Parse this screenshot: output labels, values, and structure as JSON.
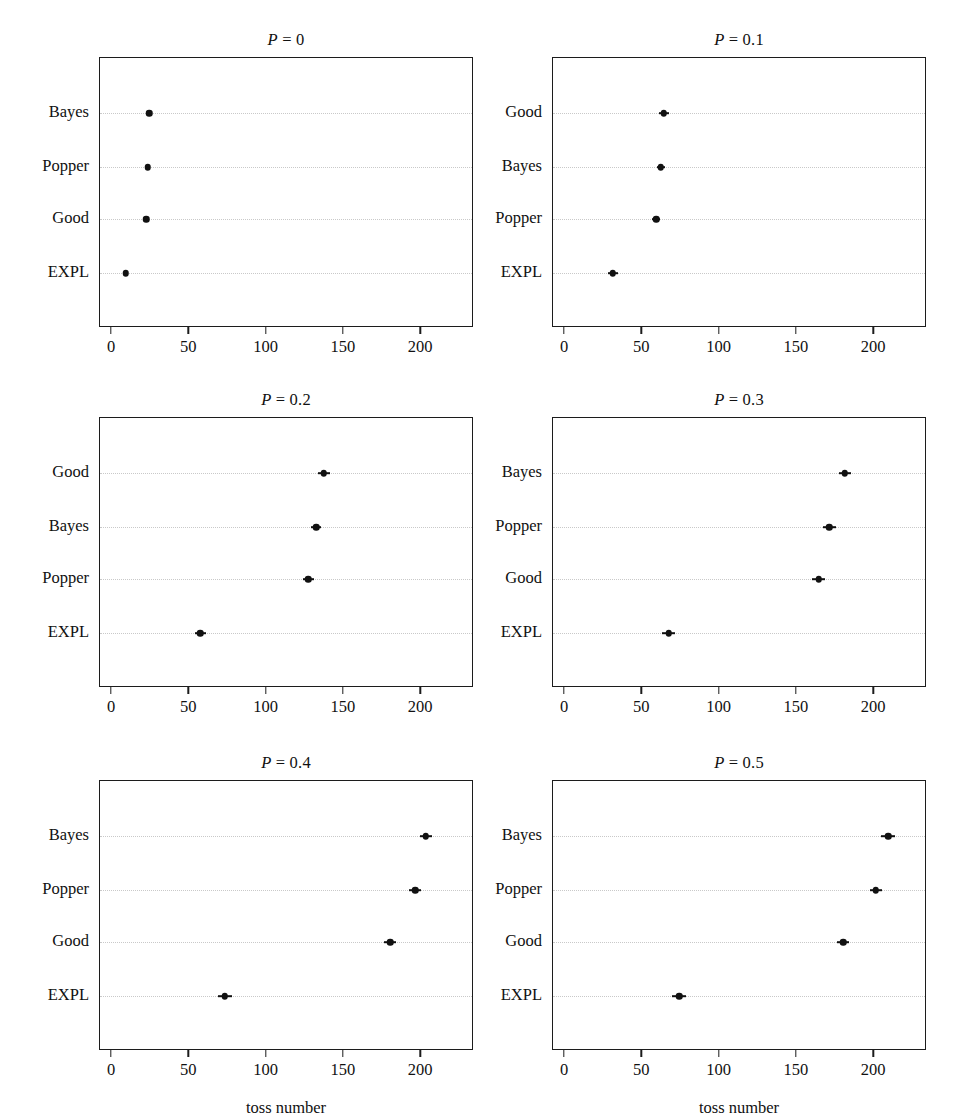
{
  "figure": {
    "xlabel": "toss number",
    "xtick_labels": [
      "0",
      "50",
      "100",
      "150",
      "200"
    ],
    "xticks": [
      0,
      50,
      100,
      150,
      200
    ],
    "xlim": [
      -8,
      234
    ],
    "marker_color": "#111111",
    "grid_color": "#c9c9c9",
    "axis_color": "#1c1c1c"
  },
  "chart_data": {
    "type": "scatter",
    "xlabel": "toss number",
    "ylabel": "",
    "xlim": [
      -8,
      234
    ],
    "xticks": [
      0,
      50,
      100,
      150,
      200
    ],
    "grid": true,
    "legend": "none",
    "orientation": "horizontal",
    "error_bars": "symmetric horizontal",
    "panels": [
      {
        "title_prefix": "P",
        "title_eq": "=",
        "title_value": "0",
        "title": "P = 0",
        "categories": [
          "Bayes",
          "Popper",
          "Good",
          "EXPL"
        ],
        "values": [
          24,
          23,
          22,
          9
        ],
        "errors": [
          1.5,
          1.5,
          1.5,
          1.5
        ]
      },
      {
        "title_prefix": "P",
        "title_eq": "=",
        "title_value": "0.1",
        "title": "P = 0.1",
        "categories": [
          "Good",
          "Bayes",
          "Popper",
          "EXPL"
        ],
        "values": [
          64,
          62,
          59,
          31
        ],
        "errors": [
          3.5,
          2.5,
          2.5,
          3.0
        ]
      },
      {
        "title_prefix": "P",
        "title_eq": "=",
        "title_value": "0.2",
        "title": "P = 0.2",
        "categories": [
          "Good",
          "Bayes",
          "Popper",
          "EXPL"
        ],
        "values": [
          137,
          132,
          127,
          57
        ],
        "errors": [
          4.0,
          3.0,
          3.5,
          3.5
        ]
      },
      {
        "title_prefix": "P",
        "title_eq": "=",
        "title_value": "0.3",
        "title": "P = 0.3",
        "categories": [
          "Bayes",
          "Popper",
          "Good",
          "EXPL"
        ],
        "values": [
          181,
          171,
          164,
          67
        ],
        "errors": [
          4.0,
          4.0,
          4.0,
          4.0
        ]
      },
      {
        "title_prefix": "P",
        "title_eq": "=",
        "title_value": "0.4",
        "title": "P = 0.4",
        "categories": [
          "Bayes",
          "Popper",
          "Good",
          "EXPL"
        ],
        "values": [
          203,
          196,
          180,
          73
        ],
        "errors": [
          4.0,
          4.0,
          4.0,
          4.5
        ]
      },
      {
        "title_prefix": "P",
        "title_eq": "=",
        "title_value": "0.5",
        "title": "P = 0.5",
        "categories": [
          "Bayes",
          "Popper",
          "Good",
          "EXPL"
        ],
        "values": [
          209,
          201,
          180,
          74
        ],
        "errors": [
          4.5,
          4.0,
          4.0,
          4.5
        ]
      }
    ]
  }
}
